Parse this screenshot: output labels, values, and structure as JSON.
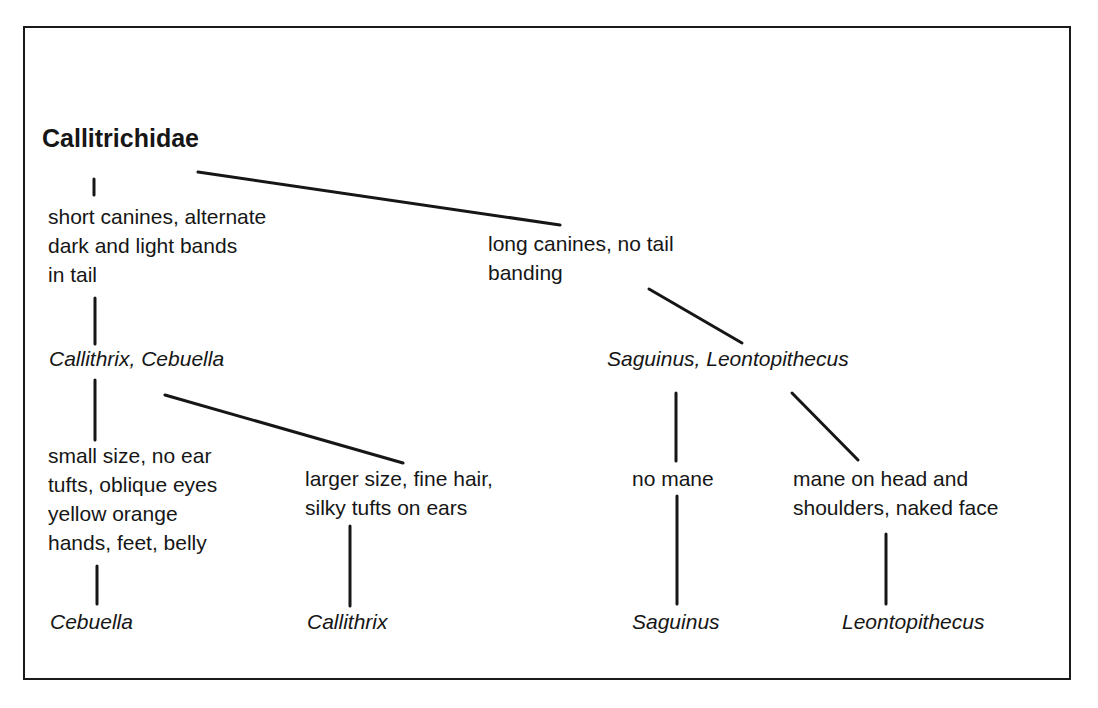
{
  "diagram": {
    "type": "taxonomic-key-tree",
    "root": {
      "label": "Callitrichidae"
    },
    "nodes": {
      "short_canines": {
        "label": "short canines, alternate\ndark and light bands\nin tail"
      },
      "long_canines": {
        "label": "long canines, no tail\nbanding"
      },
      "callithrix_cebuella": {
        "label": "Callithrix, Cebuella"
      },
      "saguinus_leontopithecus": {
        "label": "Saguinus, Leontopithecus"
      },
      "small_size": {
        "label": "small size, no ear\ntufts, oblique eyes\nyellow orange\nhands, feet, belly"
      },
      "larger_size": {
        "label": "larger size, fine hair,\nsilky tufts on ears"
      },
      "no_mane": {
        "label": "no mane"
      },
      "mane": {
        "label": "mane on head and\nshoulders, naked face"
      },
      "cebuella": {
        "label": "Cebuella"
      },
      "callithrix": {
        "label": "Callithrix"
      },
      "saguinus": {
        "label": "Saguinus"
      },
      "leontopithecus": {
        "label": "Leontopithecus"
      }
    },
    "edges": [
      [
        "root",
        "short_canines"
      ],
      [
        "root",
        "long_canines"
      ],
      [
        "short_canines",
        "callithrix_cebuella"
      ],
      [
        "long_canines",
        "saguinus_leontopithecus"
      ],
      [
        "callithrix_cebuella",
        "small_size"
      ],
      [
        "callithrix_cebuella",
        "larger_size"
      ],
      [
        "saguinus_leontopithecus",
        "no_mane"
      ],
      [
        "saguinus_leontopithecus",
        "mane"
      ],
      [
        "small_size",
        "cebuella"
      ],
      [
        "larger_size",
        "callithrix"
      ],
      [
        "no_mane",
        "saguinus"
      ],
      [
        "mane",
        "leontopithecus"
      ]
    ]
  }
}
